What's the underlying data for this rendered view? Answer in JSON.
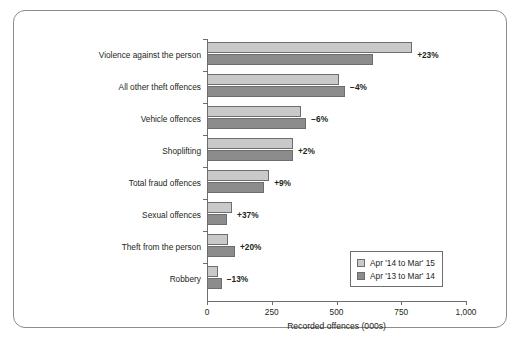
{
  "chart_data": {
    "type": "bar",
    "orientation": "horizontal",
    "title": "",
    "xlabel": "Recorded offences (000s)",
    "ylabel": "",
    "xlim": [
      0,
      1000
    ],
    "xticks": [
      0,
      250,
      500,
      750,
      1000
    ],
    "xtick_labels": [
      "0",
      "250",
      "500",
      "750",
      "1,000"
    ],
    "grid": false,
    "legend_position": "bottom-right",
    "categories": [
      "Violence against the person",
      "All other theft offences",
      "Vehicle offences",
      "Shoplifting",
      "Total fraud offences",
      "Sexual offences",
      "Theft from the person",
      "Robbery"
    ],
    "series": [
      {
        "name": "Apr '14 to Mar' 15",
        "color": "#c9c9c9",
        "values": [
          792,
          510,
          363,
          332,
          240,
          97,
          83,
          44
        ]
      },
      {
        "name": "Apr '13 to Mar' 14",
        "color": "#8c8c8c",
        "values": [
          641,
          533,
          383,
          332,
          220,
          78,
          108,
          57
        ]
      }
    ],
    "annotations": [
      "+23%",
      "−4%",
      "−6%",
      "+2%",
      "+9%",
      "+37%",
      "+20%",
      "−13%"
    ]
  },
  "legend": {
    "entries": [
      {
        "label": "Apr '14 to Mar' 15",
        "color": "#c9c9c9"
      },
      {
        "label": "Apr '13 to Mar' 14",
        "color": "#8c8c8c"
      }
    ]
  },
  "axis": {
    "x_title": "Recorded offences (000s)",
    "x_labels": [
      "0",
      "250",
      "500",
      "750",
      "1,000"
    ]
  },
  "caption": {
    "fragment": ""
  }
}
